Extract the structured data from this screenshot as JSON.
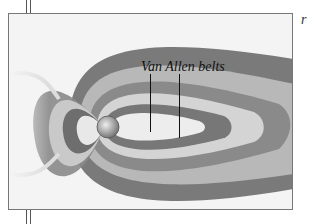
{
  "figure": {
    "label": "Van Allen belts",
    "corner_mark": "r",
    "colors": {
      "frame": "#777777",
      "belt_dark": "#6a6a6a",
      "belt_mid": "#9a9a9a",
      "belt_light": "#cfcfcf",
      "background": "#f4f4f4",
      "label_text": "#111111"
    }
  }
}
